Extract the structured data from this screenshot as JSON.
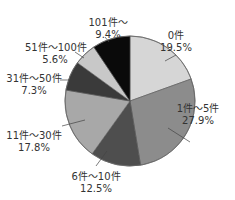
{
  "chart_data": {
    "type": "pie",
    "title": "",
    "start_angle_deg": 0,
    "direction": "clockwise",
    "categories": [
      "0件",
      "1件〜5件",
      "6件〜10件",
      "11件〜30件",
      "31件〜50件",
      "51件〜100件",
      "101件〜"
    ],
    "values": [
      19.5,
      27.9,
      12.5,
      17.8,
      7.3,
      5.6,
      9.4
    ],
    "value_labels": [
      "19.5%",
      "27.9%",
      "12.5%",
      "17.8%",
      "7.3%",
      "5.6%",
      "9.4%"
    ],
    "colors": [
      "#d6d6d6",
      "#8c8c8c",
      "#4e4e4e",
      "#a8a8a8",
      "#3a3a3a",
      "#c8c8c8",
      "#0a0a0a"
    ],
    "legend": "none (labels placed beside slices with leader lines)"
  },
  "labels": [
    {
      "name": "0件",
      "pct": "19.5%",
      "x": 182,
      "y": 27
    },
    {
      "name": "1件〜5件",
      "pct": "27.9%",
      "x": 210,
      "y": 33
    },
    {
      "name": "6件〜10件",
      "pct": "12.5%",
      "x": 96,
      "y": 172
    },
    {
      "name": "11件〜30件",
      "pct": "17.8%",
      "x": 33,
      "y": 14
    },
    {
      "name": "31件〜50件",
      "pct": "7.3%",
      "x": 27,
      "y": 72
    },
    {
      "name": "51件〜100件",
      "pct": "5.6%",
      "x": 55,
      "y": 38
    },
    {
      "name": "101件〜",
      "pct": "9.4%",
      "x": 108,
      "y": 15
    }
  ]
}
